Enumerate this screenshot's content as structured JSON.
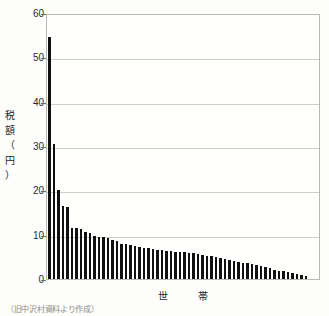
{
  "chart_data": {
    "type": "bar",
    "title": "",
    "subtitle": "",
    "xlabel": "世　帯",
    "ylabel": "税額（円）",
    "ylim": [
      0,
      60
    ],
    "ytick_labels": [
      "60",
      "50",
      "40",
      "30",
      "20",
      "10",
      "0"
    ],
    "ytick_values": [
      60,
      50,
      40,
      30,
      20,
      10,
      0
    ],
    "grid": true,
    "grid_axis": "y",
    "legend": "none",
    "bar_color": "#111111",
    "categories": [
      "1",
      "2",
      "3",
      "4",
      "5",
      "6",
      "7",
      "8",
      "9",
      "10",
      "11",
      "12",
      "13",
      "14",
      "15",
      "16",
      "17",
      "18",
      "19",
      "20",
      "21",
      "22",
      "23",
      "24",
      "25",
      "26",
      "27",
      "28",
      "29",
      "30",
      "31",
      "32",
      "33",
      "34",
      "35",
      "36",
      "37",
      "38",
      "39",
      "40",
      "41",
      "42",
      "43",
      "44",
      "45",
      "46",
      "47",
      "48",
      "49",
      "50",
      "51",
      "52",
      "53",
      "54",
      "55",
      "56",
      "57",
      "58"
    ],
    "values": [
      54.5,
      30.5,
      20.0,
      16.5,
      16.3,
      11.5,
      11.4,
      11.3,
      10.5,
      10.3,
      9.6,
      9.5,
      9.4,
      9.3,
      8.7,
      8.6,
      8.0,
      7.9,
      7.6,
      7.4,
      7.2,
      7.1,
      6.9,
      6.8,
      6.6,
      6.5,
      6.4,
      6.3,
      6.2,
      6.1,
      6.0,
      5.9,
      5.8,
      5.6,
      5.5,
      5.3,
      5.1,
      4.9,
      4.7,
      4.5,
      4.3,
      4.1,
      3.9,
      3.7,
      3.5,
      3.3,
      3.1,
      2.9,
      2.6,
      2.4,
      2.1,
      1.9,
      1.7,
      1.5,
      1.3,
      1.1,
      0.9,
      0.6
    ],
    "source_note": "（旧中沢村資料より作成）"
  }
}
